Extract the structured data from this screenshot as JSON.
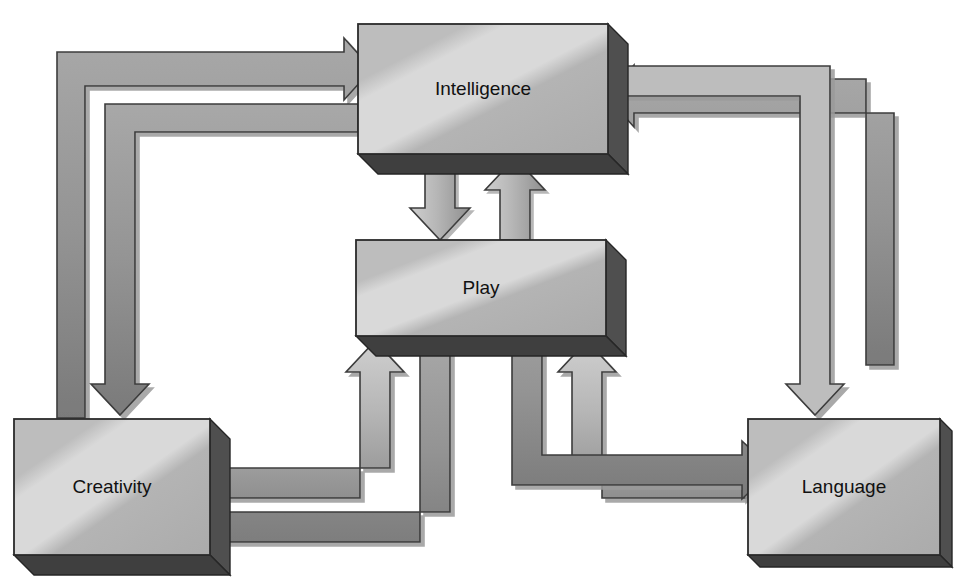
{
  "diagram": {
    "type": "block-flow-diagram",
    "background_color": "#ffffff",
    "style": {
      "box_fill_light": "#d2d2d2",
      "box_fill_mid": "#b9b9b9",
      "box_fill_dark": "#9d9d9d",
      "box_side_face": "#5a5a5a",
      "box_outline": "#2b2b2b",
      "arrow_light": "#c2c2c2",
      "arrow_dark": "#8f8f8f",
      "arrow_outline": "#3a3a3a",
      "text_color": "#111111",
      "shadow_color": "#bfbfbf"
    },
    "nodes": [
      {
        "id": "intelligence",
        "label": "Intelligence",
        "x": 358,
        "y": 24,
        "w": 250,
        "h": 130
      },
      {
        "id": "play",
        "label": "Play",
        "x": 356,
        "y": 240,
        "w": 250,
        "h": 96
      },
      {
        "id": "creativity",
        "label": "Creativity",
        "x": 14,
        "y": 419,
        "w": 196,
        "h": 136
      },
      {
        "id": "language",
        "label": "Language",
        "x": 748,
        "y": 419,
        "w": 192,
        "h": 136
      }
    ],
    "edges": [
      {
        "id": "creativity-to-intelligence",
        "from": "Creativity",
        "to": "Intelligence",
        "direction": "one-way",
        "route": "left-outer"
      },
      {
        "id": "intelligence-to-creativity",
        "from": "Intelligence",
        "to": "Creativity",
        "direction": "one-way",
        "route": "left-inner"
      },
      {
        "id": "language-to-intelligence",
        "from": "Language",
        "to": "Intelligence",
        "direction": "one-way",
        "route": "right-inner"
      },
      {
        "id": "intelligence-to-language",
        "from": "Intelligence",
        "to": "Language",
        "direction": "one-way",
        "route": "right-outer"
      },
      {
        "id": "intelligence-to-play",
        "from": "Intelligence",
        "to": "Play",
        "direction": "one-way",
        "route": "centre-down"
      },
      {
        "id": "play-to-intelligence",
        "from": "Play",
        "to": "Intelligence",
        "direction": "one-way",
        "route": "centre-up"
      },
      {
        "id": "creativity-to-play",
        "from": "Creativity",
        "to": "Play",
        "direction": "one-way",
        "route": "lower-left-inner"
      },
      {
        "id": "play-to-creativity",
        "from": "Play",
        "to": "Creativity",
        "direction": "one-way",
        "route": "lower-left-outer"
      },
      {
        "id": "language-to-play",
        "from": "Language",
        "to": "Play",
        "direction": "one-way",
        "route": "lower-right-inner"
      },
      {
        "id": "play-to-language",
        "from": "Play",
        "to": "Language",
        "direction": "one-way",
        "route": "lower-right-outer"
      }
    ]
  }
}
